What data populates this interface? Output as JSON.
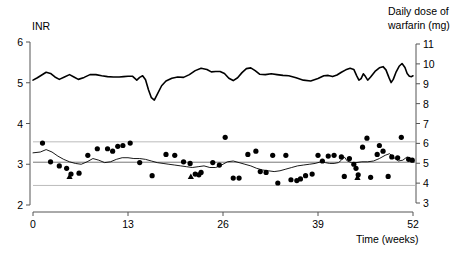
{
  "chart_data": {
    "type": "scatter",
    "title": "",
    "xlabel": "Time (weeks)",
    "xticks": [
      0,
      13,
      26,
      39,
      52
    ],
    "xlim": [
      0,
      52
    ],
    "grid": false,
    "left_axis": {
      "label": "INR",
      "ticks": [
        2,
        3,
        4,
        5,
        6
      ],
      "lim": [
        2,
        6
      ]
    },
    "right_axis": {
      "label_line1": "Daily dose of",
      "label_line2": "warfarin (mg)",
      "ticks": [
        3,
        4,
        5,
        6,
        7,
        8,
        9,
        10,
        11
      ],
      "lim": [
        3,
        11
      ]
    },
    "reference_lines": {
      "target_inr": 3.05,
      "upper_limit_inr": 3.55,
      "lower_limit_inr": 2.48,
      "color": "#bbbbbb",
      "target_color": "#777777"
    },
    "series": [
      {
        "name": "Daily dose of warfarin (mg)",
        "axis": "right",
        "type": "line",
        "color": "#000000",
        "width": 1.6,
        "points": [
          [
            0.0,
            9.18
          ],
          [
            0.6,
            9.3
          ],
          [
            1.2,
            9.44
          ],
          [
            1.8,
            9.58
          ],
          [
            2.4,
            9.52
          ],
          [
            3.0,
            9.34
          ],
          [
            3.6,
            9.22
          ],
          [
            4.3,
            9.34
          ],
          [
            5.0,
            9.46
          ],
          [
            5.6,
            9.34
          ],
          [
            6.2,
            9.22
          ],
          [
            7.0,
            9.32
          ],
          [
            7.8,
            9.46
          ],
          [
            8.6,
            9.46
          ],
          [
            9.4,
            9.4
          ],
          [
            10.2,
            9.36
          ],
          [
            11.0,
            9.34
          ],
          [
            11.8,
            9.34
          ],
          [
            12.4,
            9.36
          ],
          [
            13.0,
            9.38
          ],
          [
            13.6,
            9.38
          ],
          [
            14.2,
            9.18
          ],
          [
            14.6,
            9.32
          ],
          [
            15.0,
            9.4
          ],
          [
            15.4,
            9.2
          ],
          [
            15.8,
            8.7
          ],
          [
            16.2,
            8.3
          ],
          [
            16.6,
            8.18
          ],
          [
            17.0,
            8.46
          ],
          [
            17.6,
            8.9
          ],
          [
            18.2,
            9.14
          ],
          [
            19.0,
            9.28
          ],
          [
            19.8,
            9.34
          ],
          [
            20.6,
            9.32
          ],
          [
            21.4,
            9.46
          ],
          [
            22.2,
            9.66
          ],
          [
            23.0,
            9.78
          ],
          [
            23.8,
            9.72
          ],
          [
            24.4,
            9.6
          ],
          [
            25.0,
            9.62
          ],
          [
            25.6,
            9.62
          ],
          [
            26.2,
            9.52
          ],
          [
            26.8,
            9.28
          ],
          [
            27.4,
            9.16
          ],
          [
            28.0,
            9.3
          ],
          [
            28.6,
            9.56
          ],
          [
            29.2,
            9.76
          ],
          [
            29.8,
            9.8
          ],
          [
            30.4,
            9.66
          ],
          [
            31.0,
            9.48
          ],
          [
            31.8,
            9.46
          ],
          [
            32.6,
            9.5
          ],
          [
            33.4,
            9.46
          ],
          [
            34.2,
            9.42
          ],
          [
            35.0,
            9.4
          ],
          [
            36.0,
            9.3
          ],
          [
            37.0,
            9.18
          ],
          [
            38.0,
            9.14
          ],
          [
            39.0,
            9.26
          ],
          [
            39.8,
            9.4
          ],
          [
            40.4,
            9.42
          ],
          [
            41.0,
            9.36
          ],
          [
            41.6,
            9.44
          ],
          [
            42.2,
            9.58
          ],
          [
            42.8,
            9.7
          ],
          [
            43.4,
            9.78
          ],
          [
            43.9,
            9.72
          ],
          [
            44.3,
            9.4
          ],
          [
            44.6,
            9.18
          ],
          [
            44.9,
            9.26
          ],
          [
            45.2,
            9.5
          ],
          [
            45.5,
            9.36
          ],
          [
            45.8,
            9.18
          ],
          [
            46.2,
            9.34
          ],
          [
            46.8,
            9.62
          ],
          [
            47.4,
            9.8
          ],
          [
            47.9,
            9.86
          ],
          [
            48.3,
            9.7
          ],
          [
            48.7,
            9.32
          ],
          [
            49.0,
            9.06
          ],
          [
            49.3,
            9.22
          ],
          [
            49.7,
            9.6
          ],
          [
            50.1,
            9.88
          ],
          [
            50.5,
            10.02
          ],
          [
            50.9,
            9.82
          ],
          [
            51.2,
            9.52
          ],
          [
            51.5,
            9.38
          ],
          [
            51.8,
            9.36
          ],
          [
            52.0,
            9.4
          ]
        ]
      },
      {
        "name": "Smoothed INR",
        "axis": "left",
        "type": "line",
        "color": "#000000",
        "width": 0.9,
        "points": [
          [
            0.0,
            3.28
          ],
          [
            1.0,
            3.3
          ],
          [
            1.8,
            3.36
          ],
          [
            2.6,
            3.3
          ],
          [
            3.4,
            3.2
          ],
          [
            4.2,
            3.12
          ],
          [
            5.0,
            3.06
          ],
          [
            5.8,
            3.02
          ],
          [
            6.6,
            3.0
          ],
          [
            7.4,
            3.06
          ],
          [
            8.2,
            3.14
          ],
          [
            9.0,
            3.1
          ],
          [
            9.8,
            3.04
          ],
          [
            10.6,
            3.06
          ],
          [
            11.4,
            3.12
          ],
          [
            12.2,
            3.16
          ],
          [
            13.0,
            3.16
          ],
          [
            13.8,
            3.14
          ],
          [
            14.6,
            3.14
          ],
          [
            15.4,
            3.12
          ],
          [
            16.2,
            3.08
          ],
          [
            17.0,
            3.04
          ],
          [
            17.8,
            3.02
          ],
          [
            18.6,
            3.0
          ],
          [
            19.4,
            2.98
          ],
          [
            20.2,
            2.96
          ],
          [
            21.0,
            2.94
          ],
          [
            21.8,
            2.92
          ],
          [
            22.6,
            2.94
          ],
          [
            23.4,
            2.96
          ],
          [
            24.2,
            2.92
          ],
          [
            25.0,
            2.92
          ],
          [
            25.8,
            2.98
          ],
          [
            26.6,
            3.06
          ],
          [
            27.4,
            3.08
          ],
          [
            28.2,
            3.04
          ],
          [
            29.0,
            3.0
          ],
          [
            29.8,
            2.96
          ],
          [
            30.6,
            2.9
          ],
          [
            31.4,
            2.86
          ],
          [
            32.2,
            2.84
          ],
          [
            33.0,
            2.82
          ],
          [
            33.8,
            2.84
          ],
          [
            34.6,
            2.88
          ],
          [
            35.4,
            2.92
          ],
          [
            36.2,
            2.96
          ],
          [
            37.0,
            2.98
          ],
          [
            37.8,
            3.0
          ],
          [
            38.6,
            3.02
          ],
          [
            39.4,
            3.06
          ],
          [
            40.0,
            3.04
          ],
          [
            40.6,
            3.02
          ],
          [
            41.2,
            3.02
          ],
          [
            41.8,
            3.04
          ],
          [
            42.2,
            3.1
          ],
          [
            42.6,
            3.18
          ],
          [
            43.0,
            3.08
          ],
          [
            43.6,
            3.04
          ],
          [
            44.2,
            3.04
          ],
          [
            45.0,
            3.06
          ],
          [
            45.8,
            3.06
          ],
          [
            46.6,
            3.08
          ],
          [
            47.4,
            3.14
          ],
          [
            48.2,
            3.22
          ],
          [
            48.8,
            3.26
          ],
          [
            49.4,
            3.16
          ],
          [
            50.0,
            3.08
          ],
          [
            50.6,
            3.1
          ],
          [
            51.2,
            3.18
          ],
          [
            51.6,
            3.14
          ],
          [
            52.0,
            3.08
          ]
        ]
      },
      {
        "name": "INR measurement",
        "axis": "left",
        "type": "scatter",
        "marker": "circle",
        "color": "#000000",
        "size": 5.2,
        "points": [
          [
            1.3,
            3.52
          ],
          [
            2.4,
            3.06
          ],
          [
            3.6,
            2.96
          ],
          [
            4.6,
            2.9
          ],
          [
            5.2,
            2.76
          ],
          [
            6.3,
            2.78
          ],
          [
            7.5,
            3.22
          ],
          [
            8.8,
            3.38
          ],
          [
            10.2,
            3.38
          ],
          [
            10.9,
            3.32
          ],
          [
            11.6,
            3.44
          ],
          [
            12.3,
            3.46
          ],
          [
            13.3,
            3.52
          ],
          [
            14.6,
            3.04
          ],
          [
            16.3,
            2.72
          ],
          [
            18.2,
            3.24
          ],
          [
            19.4,
            3.22
          ],
          [
            20.6,
            3.06
          ],
          [
            21.5,
            3.02
          ],
          [
            22.2,
            2.76
          ],
          [
            22.7,
            2.74
          ],
          [
            23.0,
            2.8
          ],
          [
            24.6,
            3.04
          ],
          [
            25.5,
            2.98
          ],
          [
            26.3,
            3.66
          ],
          [
            27.4,
            2.66
          ],
          [
            28.2,
            2.66
          ],
          [
            29.4,
            3.24
          ],
          [
            30.5,
            3.32
          ],
          [
            31.1,
            2.82
          ],
          [
            31.9,
            2.8
          ],
          [
            32.8,
            3.22
          ],
          [
            33.5,
            2.54
          ],
          [
            34.6,
            3.22
          ],
          [
            35.3,
            2.62
          ],
          [
            36.1,
            2.6
          ],
          [
            36.6,
            2.64
          ],
          [
            37.3,
            2.72
          ],
          [
            38.2,
            2.76
          ],
          [
            39.0,
            3.22
          ],
          [
            39.6,
            3.08
          ],
          [
            40.4,
            3.2
          ],
          [
            41.2,
            3.22
          ],
          [
            42.2,
            3.18
          ],
          [
            42.6,
            2.7
          ],
          [
            43.3,
            3.14
          ],
          [
            43.9,
            3.0
          ],
          [
            44.2,
            2.9
          ],
          [
            44.5,
            2.74
          ],
          [
            45.1,
            3.42
          ],
          [
            45.7,
            3.64
          ],
          [
            46.2,
            2.68
          ],
          [
            47.1,
            3.24
          ],
          [
            47.4,
            3.46
          ],
          [
            47.9,
            3.32
          ],
          [
            48.6,
            2.7
          ],
          [
            49.1,
            3.18
          ],
          [
            49.9,
            3.16
          ],
          [
            50.4,
            3.66
          ],
          [
            51.4,
            3.12
          ],
          [
            51.9,
            3.1
          ]
        ]
      },
      {
        "name": "INR measurement (flagged)",
        "axis": "left",
        "type": "scatter",
        "marker": "triangle",
        "color": "#000000",
        "size": 5.0,
        "points": [
          [
            5.0,
            2.7
          ],
          [
            21.6,
            2.7
          ],
          [
            44.4,
            2.68
          ]
        ]
      }
    ]
  },
  "axes_text": {
    "left_title": "INR",
    "right_title_line1": "Daily dose of",
    "right_title_line2": "warfarin (mg)",
    "x_title": "Time (weeks)"
  }
}
